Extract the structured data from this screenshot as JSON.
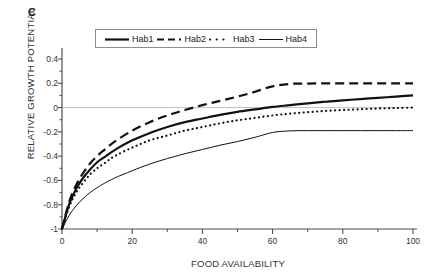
{
  "panel": {
    "label": "C"
  },
  "axes": {
    "xlabel": "FOOD AVAILABILITY",
    "ylabel": "RELATIVE GROWTH POTENTIAL",
    "xticks": [
      "0",
      "20",
      "40",
      "60",
      "80",
      "100"
    ],
    "yticks": [
      "0.4",
      "0.2",
      "0",
      "-0.2",
      "-0.4",
      "-0.6",
      "-0.8",
      "-1"
    ]
  },
  "legend": {
    "items": [
      {
        "label": "Hab1",
        "style": "solid-thick",
        "icon": "line-solid-thick-icon"
      },
      {
        "label": "Hab2",
        "style": "dashed",
        "icon": "line-dashed-icon"
      },
      {
        "label": "Hab3",
        "style": "dotted",
        "icon": "line-dotted-icon"
      },
      {
        "label": "Hab4",
        "style": "solid-thin",
        "icon": "line-solid-thin-icon"
      }
    ]
  },
  "colors": {
    "axis": "#4d4d4d",
    "zero_line": "#bfbfbf",
    "curve": "#111111",
    "text": "#333333"
  },
  "chart_data": {
    "type": "line",
    "title": "",
    "panel_label": "C",
    "xlabel": "FOOD AVAILABILITY",
    "ylabel": "RELATIVE GROWTH POTENTIAL",
    "xlim": [
      0,
      100
    ],
    "ylim": [
      -1,
      0.5
    ],
    "xticks": [
      0,
      20,
      40,
      60,
      80,
      100
    ],
    "yticks": [
      0.4,
      0.2,
      0,
      -0.2,
      -0.4,
      -0.6,
      -0.8,
      -1
    ],
    "grid": false,
    "zero_reference_line": 0,
    "legend_position": "top-center",
    "x": [
      0,
      2,
      4,
      6,
      8,
      10,
      12,
      15,
      20,
      25,
      30,
      35,
      40,
      45,
      50,
      55,
      60,
      65,
      70,
      75,
      80,
      85,
      90,
      95,
      100
    ],
    "series": [
      {
        "name": "Hab1",
        "linestyle": "solid",
        "linewidth": 2.2,
        "plateau": 0.1,
        "values": [
          -1.0,
          -0.8,
          -0.67,
          -0.58,
          -0.51,
          -0.45,
          -0.41,
          -0.35,
          -0.27,
          -0.21,
          -0.16,
          -0.12,
          -0.09,
          -0.06,
          -0.035,
          -0.015,
          0.005,
          0.02,
          0.035,
          0.048,
          0.06,
          0.07,
          0.08,
          0.09,
          0.1
        ]
      },
      {
        "name": "Hab2",
        "linestyle": "dashed",
        "linewidth": 2.2,
        "plateau": 0.2,
        "values": [
          -1.0,
          -0.78,
          -0.64,
          -0.54,
          -0.46,
          -0.4,
          -0.35,
          -0.28,
          -0.19,
          -0.12,
          -0.065,
          -0.02,
          0.02,
          0.055,
          0.09,
          0.13,
          0.175,
          0.195,
          0.198,
          0.199,
          0.2,
          0.2,
          0.2,
          0.2,
          0.2
        ]
      },
      {
        "name": "Hab3",
        "linestyle": "dotted",
        "linewidth": 2.2,
        "plateau": 0.0,
        "values": [
          -1.0,
          -0.82,
          -0.7,
          -0.62,
          -0.55,
          -0.5,
          -0.46,
          -0.4,
          -0.33,
          -0.27,
          -0.23,
          -0.19,
          -0.16,
          -0.13,
          -0.105,
          -0.085,
          -0.065,
          -0.05,
          -0.038,
          -0.028,
          -0.02,
          -0.014,
          -0.008,
          -0.004,
          0.0
        ]
      },
      {
        "name": "Hab4",
        "linestyle": "solid",
        "linewidth": 1.0,
        "plateau": -0.19,
        "values": [
          -1.0,
          -0.89,
          -0.81,
          -0.75,
          -0.7,
          -0.66,
          -0.625,
          -0.58,
          -0.52,
          -0.465,
          -0.42,
          -0.38,
          -0.345,
          -0.31,
          -0.28,
          -0.245,
          -0.205,
          -0.192,
          -0.19,
          -0.19,
          -0.19,
          -0.19,
          -0.19,
          -0.19,
          -0.19
        ]
      }
    ]
  }
}
